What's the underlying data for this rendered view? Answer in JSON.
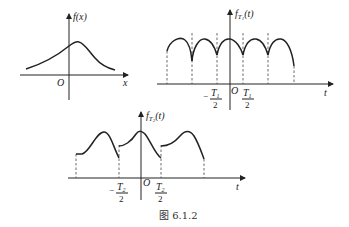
{
  "panel1": {
    "ylabel": "f(x)",
    "xlabel": "x",
    "origin": "O"
  },
  "panel2": {
    "ylabel_f": "f",
    "ylabel_sub": "T",
    "ylabel_subsub": "1",
    "ylabel_arg": "(t)",
    "xlabel": "t",
    "origin": "O",
    "tick_neg_num": "T",
    "tick_neg_sub": "1",
    "tick_den": "2",
    "tick_pos_num": "T",
    "tick_pos_sub": "1",
    "minus": "−"
  },
  "panel3": {
    "ylabel_f": "f",
    "ylabel_sub": "T",
    "ylabel_subsub": "2",
    "ylabel_arg": "(t)",
    "xlabel": "t",
    "origin": "O",
    "tick_neg_num": "T",
    "tick_neg_sub": "2",
    "tick_den": "2",
    "tick_pos_num": "T",
    "tick_pos_sub": "2",
    "minus": "−"
  },
  "caption": "图 6.1.2"
}
